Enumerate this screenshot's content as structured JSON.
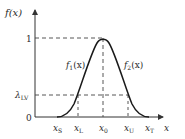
{
  "diagram": {
    "type": "membership-function",
    "y_axis_label": "f(x)",
    "x_axis_label": "x",
    "y_ticks": {
      "one": "1",
      "lambda": "λ",
      "lambda_sub": "LV",
      "zero": "0"
    },
    "x_ticks": [
      {
        "base": "x",
        "sub": "S"
      },
      {
        "base": "x",
        "sub": "L"
      },
      {
        "base": "x",
        "sub": "0"
      },
      {
        "base": "x",
        "sub": "U"
      },
      {
        "base": "x",
        "sub": "T"
      }
    ],
    "curve_labels": {
      "left": {
        "base": "f",
        "sub": "1",
        "arg": "(x)"
      },
      "right": {
        "base": "f",
        "sub": "2",
        "arg": "(x)"
      }
    },
    "colors": {
      "axis": "#333333",
      "curve": "#1a1a1a",
      "dashed": "#444444"
    }
  }
}
